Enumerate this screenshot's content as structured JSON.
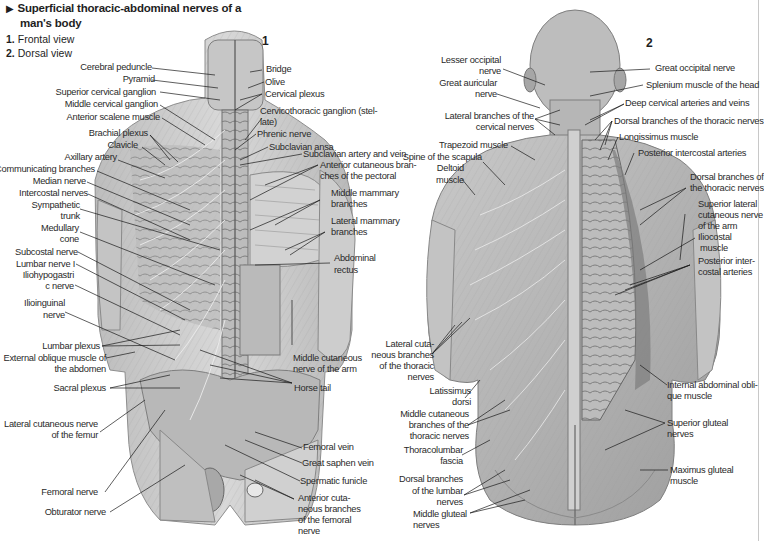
{
  "header": {
    "title_line1": "Superficial thoracic-abdominal nerves of a",
    "title_line2": "man's body",
    "bullet_icon": "right-triangle",
    "views": [
      {
        "num": "1.",
        "label": "Frontal view"
      },
      {
        "num": "2.",
        "label": "Dorsal view"
      }
    ]
  },
  "figures": [
    {
      "number": "1",
      "view": "frontal"
    },
    {
      "number": "2",
      "view": "dorsal"
    }
  ],
  "figure1_labels_left": [
    "Cerebral peduncle",
    "Pyramid",
    "Superior cervical ganglion",
    "Middle cervical ganglion",
    "Anterior scalene muscle",
    "Brachial plexus",
    "Clavicle",
    "Axillary artery",
    "Communicating branches",
    "Median nerve",
    "Intercostal nerves",
    "Sympathetic",
    "trunk",
    "Medullary",
    "cone",
    "Subcostal nerve",
    "Lumbar nerve I",
    "Iliohypogastri",
    "c nerve",
    "Ilioinguinal",
    "nerve",
    "Lumbar plexus",
    "External oblique muscle of",
    "the abdomen",
    "Sacral plexus",
    "Lateral cutaneous nerve",
    "of the femur",
    "Femoral nerve",
    "Obturator nerve"
  ],
  "figure1_labels_right": [
    "Bridge",
    "Olive",
    "Cervical plexus",
    "Cervicothoracic ganglion (stel-",
    "late)",
    "Phrenic nerve",
    "Subclavian ansa",
    "Subclavian artery and vein",
    "Anterior cutaneous bran-",
    "ches of the pectoral",
    "Middle mammary",
    "branches",
    "Lateral mammary",
    "branches",
    "Abdominal",
    "rectus",
    "Middle cutaneous",
    "nerve of the arm",
    "Horse tail",
    "Femoral vein",
    "Great saphen vein",
    "Spermatic funicle",
    "Anterior cuta-",
    "neous branches",
    "of the femoral",
    "nerve"
  ],
  "figure2_labels_left": [
    "Lesser occipital",
    "nerve",
    "Great auricular",
    "nerve",
    "Lateral branches of the",
    "cervical nerves",
    "Trapezoid muscle",
    "Spine of the scapula",
    "Deltoid",
    "muscle",
    "Lateral cuta-",
    "neous branches",
    "of the thoracic",
    "nerves",
    "Latissimus",
    "dorsi",
    "Middle cutaneous",
    "branches of the",
    "thoracic nerves",
    "Thoracolumbar",
    "fascia",
    "Dorsal branches",
    "of the lumbar",
    "nerves",
    "Middle gluteal",
    "nerves"
  ],
  "figure2_labels_right": [
    "Great occipital nerve",
    "Splenium muscle of the head",
    "Deep cervical arteries and veins",
    "Dorsal branches of the thoracic nerves",
    "Longissimus muscle",
    "Posterior intercostal arteries",
    "Dorsal branches of",
    "the thoracic nerves",
    "Superior lateral",
    "cutaneous nerve",
    "of the arm",
    "Iliocostal",
    "muscle",
    "Posterior inter-",
    "costal arteries",
    "Internal abdominal obli-",
    "que muscle",
    "Superior gluteal",
    "nerves",
    "Maximus gluteal",
    "muscle"
  ],
  "colors": {
    "text": "#2a2a2a",
    "illustration_light": "#d9d9d9",
    "illustration_mid": "#a9a9a9",
    "illustration_dark": "#6e6e6e",
    "leader_line": "#1a1a1a",
    "page_edge": "#c8c8c8"
  }
}
